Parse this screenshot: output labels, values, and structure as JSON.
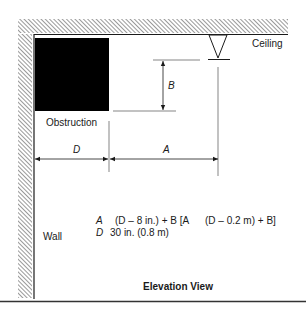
{
  "diagram": {
    "labels": {
      "ceiling": "Ceiling",
      "obstruction": "Obstruction",
      "wall": "Wall",
      "dimension_b": "B",
      "dimension_d": "D",
      "dimension_a": "A",
      "view_title": "Elevation View"
    },
    "formula": {
      "line1_var": "A",
      "line1_expr": "(D – 8 in.) + B [A",
      "line1_expr2": "(D – 0.2 m) + B]",
      "line2_var": "D",
      "line2_expr": "30 in. (0.8 m)"
    },
    "colors": {
      "ink": "#1a1a1a",
      "obstruction_fill": "#000000",
      "hatch": "#555555",
      "rule": "#333333"
    }
  }
}
